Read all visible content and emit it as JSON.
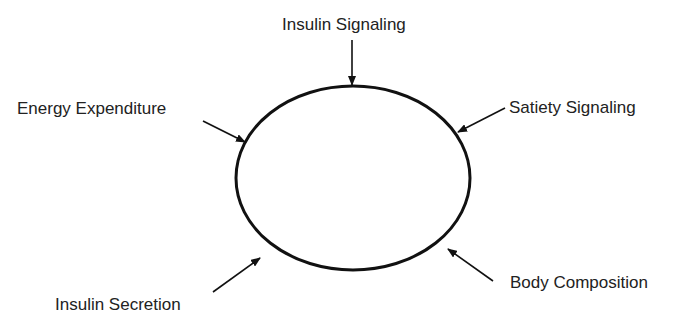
{
  "diagram": {
    "center_shape": "ellipse",
    "labels": {
      "top": "Insulin Signaling",
      "upper_left": "Energy Expenditure",
      "upper_right": "Satiety Signaling",
      "lower_left": "Insulin Secretion",
      "lower_right": "Body Composition"
    },
    "colors": {
      "stroke": "#111111",
      "text": "#222222",
      "background": "#ffffff"
    }
  }
}
